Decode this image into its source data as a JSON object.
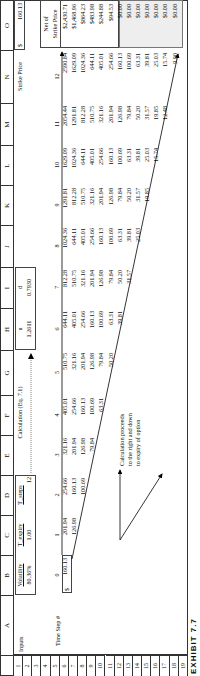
{
  "caption": "EXHIBIT 7.7",
  "columns": [
    "A",
    "B",
    "C",
    "D",
    "E",
    "F",
    "G",
    "H",
    "I",
    "J",
    "K",
    "L",
    "M",
    "N",
    "O"
  ],
  "rows": [
    "1",
    "2",
    "3",
    "4",
    "5",
    "6",
    "7",
    "8",
    "9",
    "10",
    "11",
    "12",
    "13",
    "14",
    "15",
    "16",
    "17",
    "18",
    "19"
  ],
  "inputs": {
    "label": "Inputs",
    "volatility_label": "Volatility",
    "volatility": "80.36%",
    "t_expiry_label": "T_expiry",
    "t_expiry": "1.00",
    "t_steps_label": "T_steps",
    "t_steps": "12"
  },
  "calc_label": "Calculation (Eq. 7.1)",
  "u_label": "u",
  "u_value": "1.2611",
  "d_label": "d",
  "d_value": "0.7930",
  "strike": {
    "label": "Strike Price",
    "currency": "$",
    "value": "160.13"
  },
  "time_step_label": "Time Step #",
  "start_price": {
    "currency": "$",
    "value": "160.13"
  },
  "net_header": [
    "Net of",
    "Strike Price"
  ],
  "annotation": [
    "Calculation proceeds",
    "to the right and down",
    "to expiry of option"
  ],
  "steps": [
    "0",
    "1",
    "2",
    "3",
    "4",
    "5",
    "6",
    "7",
    "8",
    "9",
    "10",
    "11",
    "12"
  ],
  "lattice": [
    [
      "160.13"
    ],
    [
      "201.94",
      "126.98"
    ],
    [
      "254.66",
      "160.13",
      "100.69"
    ],
    [
      "321.16",
      "201.94",
      "126.98",
      "79.84"
    ],
    [
      "405.01",
      "254.66",
      "160.13",
      "100.69",
      "63.31"
    ],
    [
      "510.75",
      "321.16",
      "201.94",
      "126.98",
      "79.84",
      "50.20"
    ],
    [
      "644.11",
      "405.01",
      "254.66",
      "160.13",
      "100.69",
      "63.31",
      "39.81"
    ],
    [
      "812.28",
      "510.75",
      "321.16",
      "201.94",
      "126.98",
      "79.84",
      "50.20",
      "31.57"
    ],
    [
      "1024.36",
      "644.11",
      "405.01",
      "254.66",
      "160.13",
      "100.69",
      "63.31",
      "39.81",
      "25.03"
    ],
    [
      "1291.81",
      "812.28",
      "510.75",
      "321.16",
      "201.94",
      "126.98",
      "79.84",
      "50.20",
      "31.57",
      "19.85"
    ],
    [
      "1629.09",
      "1024.36",
      "644.11",
      "405.01",
      "254.66",
      "160.13",
      "100.69",
      "63.31",
      "39.81",
      "25.03",
      "15.74"
    ],
    [
      "2054.44",
      "1291.81",
      "812.28",
      "510.75",
      "321.16",
      "201.94",
      "126.98",
      "79.84",
      "50.20",
      "31.57",
      "19.85",
      "12.48"
    ],
    [
      "2590.84",
      "1629.09",
      "1024.36",
      "644.11",
      "405.01",
      "254.66",
      "160.13",
      "100.69",
      "63.31",
      "39.81",
      "25.03",
      "15.74",
      "9.90"
    ]
  ],
  "net_values": [
    "$2,430.71",
    "$1,468.96",
    "$864.23",
    "$483.98",
    "$244.88",
    "$94.53",
    "$0.00",
    "$0.00",
    "$0.00",
    "$0.00",
    "$0.00",
    "$0.00",
    "$0.00"
  ]
}
